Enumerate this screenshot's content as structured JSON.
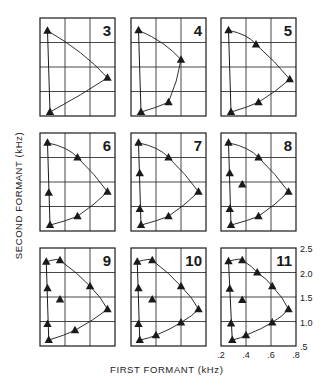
{
  "chart_data": {
    "type": "scatter",
    "title": "",
    "xlabel": "FIRST FORMANT (kHz)",
    "ylabel": "SECOND FORMANT (kHz)",
    "xlim": [
      0.2,
      0.8
    ],
    "ylim": [
      0.5,
      2.5
    ],
    "xticks": [
      ".2",
      ".4",
      ".6",
      ".8"
    ],
    "yticks": [
      ".5",
      "1.0",
      "1.5",
      "2.0",
      "2.5"
    ],
    "grid": true,
    "legend": null,
    "layout": "3x3 small multiples, numbered panels (vowel-system size)",
    "panels": [
      {
        "label": "3",
        "points": [
          [
            0.26,
            2.24
          ],
          [
            0.74,
            1.28
          ],
          [
            0.28,
            0.58
          ]
        ]
      },
      {
        "label": "4",
        "points": [
          [
            0.26,
            2.25
          ],
          [
            0.6,
            1.65
          ],
          [
            0.5,
            0.78
          ],
          [
            0.28,
            0.58
          ]
        ]
      },
      {
        "label": "5",
        "points": [
          [
            0.26,
            2.25
          ],
          [
            0.48,
            1.96
          ],
          [
            0.75,
            1.25
          ],
          [
            0.5,
            0.78
          ],
          [
            0.28,
            0.58
          ]
        ]
      },
      {
        "label": "6",
        "points": [
          [
            0.26,
            2.3
          ],
          [
            0.5,
            2.0
          ],
          [
            0.74,
            1.3
          ],
          [
            0.5,
            0.8
          ],
          [
            0.28,
            0.62
          ],
          [
            0.27,
            1.28
          ]
        ]
      },
      {
        "label": "7",
        "points": [
          [
            0.26,
            2.3
          ],
          [
            0.5,
            2.0
          ],
          [
            0.74,
            1.3
          ],
          [
            0.5,
            0.8
          ],
          [
            0.28,
            0.62
          ],
          [
            0.27,
            0.95
          ],
          [
            0.27,
            1.68
          ]
        ]
      },
      {
        "label": "8",
        "points": [
          [
            0.26,
            2.3
          ],
          [
            0.5,
            2.0
          ],
          [
            0.74,
            1.3
          ],
          [
            0.5,
            0.8
          ],
          [
            0.28,
            0.62
          ],
          [
            0.27,
            0.95
          ],
          [
            0.27,
            1.68
          ],
          [
            0.37,
            1.45
          ]
        ]
      },
      {
        "label": "9",
        "points": [
          [
            0.25,
            2.22
          ],
          [
            0.36,
            2.25
          ],
          [
            0.6,
            1.72
          ],
          [
            0.74,
            1.25
          ],
          [
            0.48,
            0.82
          ],
          [
            0.27,
            0.62
          ],
          [
            0.26,
            0.95
          ],
          [
            0.26,
            1.68
          ],
          [
            0.36,
            1.45
          ]
        ]
      },
      {
        "label": "10",
        "points": [
          [
            0.25,
            2.22
          ],
          [
            0.37,
            2.25
          ],
          [
            0.6,
            1.72
          ],
          [
            0.74,
            1.25
          ],
          [
            0.6,
            0.98
          ],
          [
            0.4,
            0.72
          ],
          [
            0.27,
            0.62
          ],
          [
            0.26,
            0.95
          ],
          [
            0.26,
            1.68
          ],
          [
            0.37,
            1.45
          ]
        ]
      },
      {
        "label": "11",
        "points": [
          [
            0.26,
            2.23
          ],
          [
            0.37,
            2.25
          ],
          [
            0.49,
            2.0
          ],
          [
            0.61,
            1.72
          ],
          [
            0.74,
            1.25
          ],
          [
            0.61,
            0.98
          ],
          [
            0.4,
            0.72
          ],
          [
            0.29,
            0.62
          ],
          [
            0.28,
            0.96
          ],
          [
            0.27,
            1.67
          ],
          [
            0.37,
            1.44
          ]
        ]
      }
    ]
  },
  "axis_labels": {
    "x": "FIRST FORMANT (kHz)",
    "y": "SECOND FORMANT (kHz)"
  },
  "colors": {
    "ink": "#1a1a1a",
    "grid": "#333333",
    "background": "#ffffff"
  }
}
